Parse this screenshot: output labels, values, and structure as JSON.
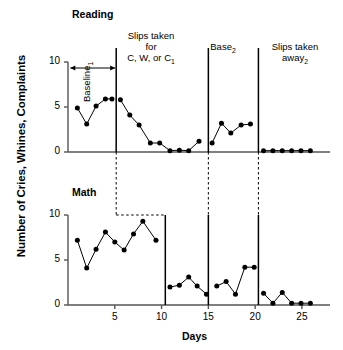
{
  "figure": {
    "ylabel": "Number of Cries, Whines, Complaints",
    "xlabel": "Days"
  },
  "panels": {
    "reading": {
      "title": "Reading"
    },
    "math": {
      "title": "Math"
    }
  },
  "phase_labels": {
    "baseline1": "Baseline",
    "baseline1_sub": "1",
    "treatment1_line1": "Slips taken",
    "treatment1_line2": "for",
    "treatment1_line3": "C, W, or C",
    "treatment1_sub": "1",
    "base2": "Base",
    "base2_sub": "2",
    "withdraw_line1": "Slips taken",
    "withdraw_line2": "away",
    "withdraw_sub": "2"
  },
  "axes": {
    "y_ticks": [
      "0",
      "5",
      "10"
    ],
    "x_ticks": [
      "5",
      "10",
      "15",
      "20",
      "25"
    ],
    "ylim": [
      0,
      10
    ],
    "xlim": [
      0,
      28
    ]
  },
  "chart_data": {
    "type": "line",
    "xlabel": "Days",
    "ylabel": "Number of Cries, Whines, Complaints",
    "xlim": [
      0,
      28
    ],
    "ylim": [
      0,
      10
    ],
    "xticks": [
      5,
      10,
      15,
      20,
      25
    ],
    "yticks": [
      0,
      5,
      10
    ],
    "grid": false,
    "legend": "none",
    "design": "multiple-baseline across behaviors with withdrawal",
    "panels": [
      {
        "name": "Reading",
        "phases": [
          {
            "label": "Baseline1",
            "x": [
              1,
              2,
              3,
              4,
              5
            ],
            "y": [
              4.9,
              3.1,
              5.1,
              5.9,
              5.9
            ],
            "points": [
              {
                "x": 1,
                "y": 4.9
              },
              {
                "x": 2,
                "y": 3.1
              },
              {
                "x": 3,
                "y": 5.1
              },
              {
                "x": 4,
                "y": 5.9
              },
              {
                "x": 4.7,
                "y": 5.9
              }
            ]
          },
          {
            "label": "Slips taken for C, W, or C1",
            "points": [
              {
                "x": 5.6,
                "y": 5.8
              },
              {
                "x": 6.6,
                "y": 4.1
              },
              {
                "x": 7.6,
                "y": 3.0
              },
              {
                "x": 8.8,
                "y": 1.0
              },
              {
                "x": 9.8,
                "y": 1.0
              },
              {
                "x": 10.9,
                "y": 0.15
              },
              {
                "x": 11.9,
                "y": 0.2
              },
              {
                "x": 12.9,
                "y": 0.15
              },
              {
                "x": 14.0,
                "y": 1.2
              }
            ]
          },
          {
            "label": "Base2",
            "points": [
              {
                "x": 15.4,
                "y": 1.0
              },
              {
                "x": 16.4,
                "y": 3.2
              },
              {
                "x": 17.4,
                "y": 2.1
              },
              {
                "x": 18.5,
                "y": 3.0
              },
              {
                "x": 19.5,
                "y": 3.1
              }
            ]
          },
          {
            "label": "Slips taken away2",
            "points": [
              {
                "x": 20.9,
                "y": 0.15
              },
              {
                "x": 21.9,
                "y": 0.15
              },
              {
                "x": 22.9,
                "y": 0.15
              },
              {
                "x": 23.9,
                "y": 0.15
              },
              {
                "x": 24.9,
                "y": 0.15
              },
              {
                "x": 25.9,
                "y": 0.15
              }
            ]
          }
        ]
      },
      {
        "name": "Math",
        "phases": [
          {
            "label": "Baseline",
            "points": [
              {
                "x": 1,
                "y": 7.2
              },
              {
                "x": 2,
                "y": 4.1
              },
              {
                "x": 3,
                "y": 6.2
              },
              {
                "x": 4,
                "y": 8.1
              },
              {
                "x": 5,
                "y": 7.0
              },
              {
                "x": 6,
                "y": 6.1
              },
              {
                "x": 7,
                "y": 7.9
              },
              {
                "x": 8,
                "y": 9.3
              },
              {
                "x": 9.4,
                "y": 7.2
              }
            ]
          },
          {
            "label": "Slips taken for C, W, or C1",
            "points": [
              {
                "x": 10.9,
                "y": 2.0
              },
              {
                "x": 11.9,
                "y": 2.2
              },
              {
                "x": 12.9,
                "y": 3.1
              },
              {
                "x": 13.8,
                "y": 2.1
              },
              {
                "x": 14.8,
                "y": 1.2
              }
            ]
          },
          {
            "label": "Base2",
            "points": [
              {
                "x": 15.9,
                "y": 2.1
              },
              {
                "x": 16.9,
                "y": 2.6
              },
              {
                "x": 17.9,
                "y": 1.2
              },
              {
                "x": 18.9,
                "y": 4.2
              },
              {
                "x": 19.9,
                "y": 4.2
              }
            ]
          },
          {
            "label": "Slips taken away2",
            "points": [
              {
                "x": 20.9,
                "y": 1.3
              },
              {
                "x": 21.9,
                "y": 0.2
              },
              {
                "x": 22.9,
                "y": 1.4
              },
              {
                "x": 23.9,
                "y": 0.2
              },
              {
                "x": 24.9,
                "y": 0.2
              },
              {
                "x": 25.9,
                "y": 0.2
              }
            ]
          }
        ]
      }
    ]
  }
}
